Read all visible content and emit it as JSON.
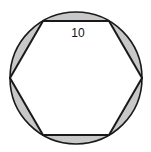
{
  "figure": {
    "shape": "regular hexagon inscribed in circle",
    "side_label": "10",
    "colors": {
      "background": "#ffffff",
      "segment_fill": "#c8c8c8",
      "stroke": "#1a1a1a"
    }
  }
}
